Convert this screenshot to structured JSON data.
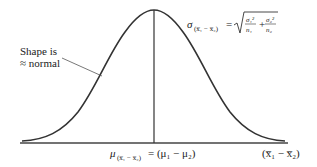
{
  "diagram": {
    "type": "normal-distribution-curve",
    "shape_label": {
      "line1": "Shape is",
      "line2": "≈ normal"
    },
    "sd_formula": {
      "lhs_symbol": "σ",
      "lhs_subscript": "(x̅₁ − x̅₂)",
      "equals": "=",
      "sqrt_symbol": "√",
      "term1_num": "σ₁²",
      "term1_den": "n₁",
      "plus": "+",
      "term2_num": "σ₂²",
      "term2_den": "n₂"
    },
    "mean_label": {
      "symbol": "μ",
      "subscript": "(x̅₁ − x̅₂)",
      "rhs": "= (μ₁ − μ₂)"
    },
    "axis_label": "(x̅₁ − x̅₂)",
    "colors": {
      "curve": "#333333",
      "axis": "#444444",
      "text": "#222222",
      "background": "#ffffff"
    }
  }
}
